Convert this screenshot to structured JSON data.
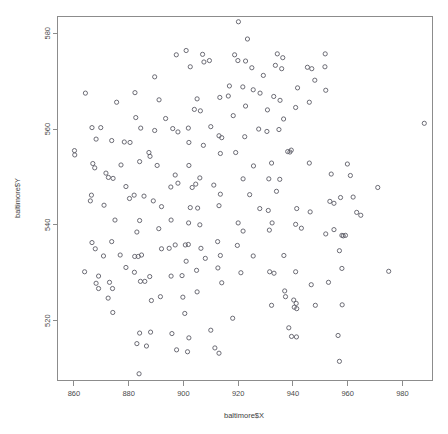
{
  "chart_data": {
    "type": "scatter",
    "title": "",
    "xlabel": "baltimore$X",
    "ylabel": "baltimore$Y",
    "xlim": [
      854,
      991
    ],
    "ylim": [
      507.5,
      583.5
    ],
    "xticks": [
      860,
      880,
      900,
      920,
      940,
      960,
      980
    ],
    "yticks": [
      520,
      540,
      560,
      580
    ],
    "xtick_labels": [
      "860",
      "880",
      "900",
      "920",
      "940",
      "960",
      "980"
    ],
    "ytick_labels": [
      "520",
      "540",
      "560",
      "580"
    ],
    "grid": false,
    "legend": null,
    "marker": "open-circle",
    "marker_size": 2.1,
    "point_color": "#5c5c66",
    "axis_color": "#8c8c8c",
    "background": "#ffffff",
    "n_points": 223,
    "points": [
      [
        920.1,
        582.4
      ],
      [
        923.4,
        578.8
      ],
      [
        901.0,
        576.4
      ],
      [
        897.4,
        575.5
      ],
      [
        907.0,
        575.6
      ],
      [
        918.7,
        575.5
      ],
      [
        934.3,
        575.7
      ],
      [
        936.3,
        574.9
      ],
      [
        951.8,
        575.7
      ],
      [
        902.5,
        573.0
      ],
      [
        907.5,
        574.0
      ],
      [
        909.5,
        574.3
      ],
      [
        919.9,
        574.3
      ],
      [
        922.7,
        574.2
      ],
      [
        933.6,
        573.3
      ],
      [
        945.3,
        572.9
      ],
      [
        946.9,
        572.6
      ],
      [
        951.7,
        573.0
      ],
      [
        925.0,
        572.8
      ],
      [
        935.9,
        572.6
      ],
      [
        889.5,
        570.9
      ],
      [
        916.8,
        569.0
      ],
      [
        921.7,
        568.8
      ],
      [
        925.5,
        568.2
      ],
      [
        941.7,
        568.6
      ],
      [
        952.0,
        568.1
      ],
      [
        864.2,
        567.5
      ],
      [
        882.3,
        567.6
      ],
      [
        933.0,
        566.8
      ],
      [
        875.6,
        565.6
      ],
      [
        891.1,
        566.1
      ],
      [
        905.0,
        566.3
      ],
      [
        913.3,
        566.6
      ],
      [
        935.3,
        566.0
      ],
      [
        946.0,
        565.6
      ],
      [
        922.7,
        564.8
      ],
      [
        904.0,
        564.1
      ],
      [
        906.2,
        563.8
      ],
      [
        930.7,
        564.0
      ],
      [
        941.0,
        564.5
      ],
      [
        882.6,
        562.4
      ],
      [
        893.5,
        562.2
      ],
      [
        918.2,
        562.8
      ],
      [
        936.6,
        562.1
      ],
      [
        988.0,
        561.2
      ],
      [
        866.6,
        560.3
      ],
      [
        869.8,
        560.3
      ],
      [
        884.4,
        560.2
      ],
      [
        889.5,
        559.7
      ],
      [
        896.1,
        560.1
      ],
      [
        898.0,
        559.4
      ],
      [
        901.8,
        560.2
      ],
      [
        927.5,
        560.0
      ],
      [
        930.5,
        559.5
      ],
      [
        934.9,
        559.9
      ],
      [
        913.0,
        558.6
      ],
      [
        914.0,
        558.2
      ],
      [
        922.4,
        558.4
      ],
      [
        868.1,
        557.9
      ],
      [
        873.8,
        557.6
      ],
      [
        878.4,
        557.3
      ],
      [
        880.5,
        557.2
      ],
      [
        902.0,
        557.2
      ],
      [
        907.3,
        556.6
      ],
      [
        860.2,
        555.5
      ],
      [
        860.3,
        554.6
      ],
      [
        887.4,
        555.1
      ],
      [
        887.8,
        554.3
      ],
      [
        919.1,
        555.1
      ],
      [
        913.5,
        554.9
      ],
      [
        938.1,
        555.3
      ],
      [
        938.9,
        555.2
      ],
      [
        939.4,
        555.6
      ],
      [
        866.9,
        552.8
      ],
      [
        867.6,
        551.9
      ],
      [
        877.2,
        552.5
      ],
      [
        890.4,
        552.4
      ],
      [
        902.0,
        552.4
      ],
      [
        925.6,
        552.3
      ],
      [
        932.2,
        552.9
      ],
      [
        946.0,
        552.9
      ],
      [
        959.9,
        552.7
      ],
      [
        871.7,
        550.8
      ],
      [
        872.6,
        549.9
      ],
      [
        874.3,
        549.7
      ],
      [
        897.0,
        550.4
      ],
      [
        954.0,
        550.6
      ],
      [
        961.0,
        550.3
      ],
      [
        898.0,
        548.7
      ],
      [
        904.5,
        548.5
      ],
      [
        906.0,
        549.8
      ],
      [
        921.8,
        549.6
      ],
      [
        931.2,
        549.6
      ],
      [
        935.2,
        549.5
      ],
      [
        895.4,
        547.9
      ],
      [
        903.2,
        547.8
      ],
      [
        911.1,
        548.3
      ],
      [
        971.0,
        547.8
      ],
      [
        882.0,
        546.2
      ],
      [
        866.4,
        546.2
      ],
      [
        913.5,
        546.4
      ],
      [
        924.2,
        546.3
      ],
      [
        885.6,
        546.0
      ],
      [
        880.3,
        545.5
      ],
      [
        957.4,
        545.7
      ],
      [
        962.0,
        545.8
      ],
      [
        953.5,
        544.9
      ],
      [
        955.0,
        544.5
      ],
      [
        871.0,
        544.1
      ],
      [
        892.0,
        543.8
      ],
      [
        913.0,
        544.0
      ],
      [
        902.5,
        543.6
      ],
      [
        905.2,
        543.5
      ],
      [
        927.9,
        543.4
      ],
      [
        931.0,
        543.0
      ],
      [
        941.4,
        543.4
      ],
      [
        946.3,
        542.7
      ],
      [
        963.3,
        542.6
      ],
      [
        964.8,
        542.0
      ],
      [
        875.0,
        541.0
      ],
      [
        884.0,
        540.9
      ],
      [
        895.5,
        541.0
      ],
      [
        901.9,
        540.4
      ],
      [
        906.0,
        540.0
      ],
      [
        920.0,
        540.4
      ],
      [
        932.4,
        540.4
      ],
      [
        941.0,
        540.1
      ],
      [
        943.1,
        539.3
      ],
      [
        883.0,
        538.5
      ],
      [
        891.0,
        539.2
      ],
      [
        931.4,
        538.9
      ],
      [
        921.8,
        538.7
      ],
      [
        952.0,
        538.1
      ],
      [
        957.9,
        537.8
      ],
      [
        958.4,
        537.7
      ],
      [
        959.2,
        537.8
      ],
      [
        866.6,
        536.3
      ],
      [
        873.8,
        536.5
      ],
      [
        912.5,
        536.5
      ],
      [
        897.0,
        535.8
      ],
      [
        900.7,
        535.8
      ],
      [
        901.8,
        535.9
      ],
      [
        919.7,
        535.7
      ],
      [
        867.8,
        535.0
      ],
      [
        892.0,
        535.0
      ],
      [
        894.8,
        535.1
      ],
      [
        906.4,
        535.1
      ],
      [
        957.0,
        534.6
      ],
      [
        870.8,
        533.5
      ],
      [
        876.9,
        533.7
      ],
      [
        882.2,
        533.4
      ],
      [
        883.5,
        533.4
      ],
      [
        884.7,
        533.7
      ],
      [
        913.5,
        533.6
      ],
      [
        925.5,
        533.5
      ],
      [
        936.7,
        533.6
      ],
      [
        901.0,
        532.4
      ],
      [
        879.0,
        531.1
      ],
      [
        912.6,
        531.0
      ],
      [
        957.9,
        530.9
      ],
      [
        863.9,
        530.2
      ],
      [
        882.1,
        530.1
      ],
      [
        904.8,
        530.5
      ],
      [
        931.5,
        530.2
      ],
      [
        933.1,
        529.9
      ],
      [
        941.0,
        530.2
      ],
      [
        975.0,
        530.3
      ],
      [
        869.0,
        529.3
      ],
      [
        887.7,
        529.2
      ],
      [
        895.5,
        529.3
      ],
      [
        899.5,
        529.4
      ],
      [
        868.1,
        527.8
      ],
      [
        884.3,
        528.2
      ],
      [
        885.9,
        528.2
      ],
      [
        914.0,
        527.9
      ],
      [
        946.7,
        527.5
      ],
      [
        874.1,
        526.7
      ],
      [
        869.0,
        526.7
      ],
      [
        937.0,
        526.2
      ],
      [
        872.5,
        524.7
      ],
      [
        888.3,
        524.2
      ],
      [
        891.6,
        525.0
      ],
      [
        899.8,
        524.9
      ],
      [
        937.3,
        525.0
      ],
      [
        940.3,
        524.3
      ],
      [
        941.2,
        523.6
      ],
      [
        932.2,
        523.2
      ],
      [
        940.5,
        522.8
      ],
      [
        941.4,
        522.5
      ],
      [
        948.2,
        523.2
      ],
      [
        958.0,
        523.3
      ],
      [
        874.2,
        521.7
      ],
      [
        900.5,
        521.5
      ],
      [
        938.5,
        518.5
      ],
      [
        884.0,
        517.4
      ],
      [
        888.0,
        517.6
      ],
      [
        895.8,
        517.3
      ],
      [
        910.0,
        518.0
      ],
      [
        902.0,
        516.4
      ],
      [
        939.5,
        516.7
      ],
      [
        941.3,
        516.6
      ],
      [
        956.5,
        516.9
      ],
      [
        883.0,
        515.2
      ],
      [
        886.5,
        514.7
      ],
      [
        897.5,
        513.9
      ],
      [
        901.5,
        513.5
      ],
      [
        911.5,
        514.3
      ],
      [
        913.0,
        513.2
      ],
      [
        957.0,
        511.5
      ],
      [
        883.8,
        508.9
      ],
      [
        916.4,
        566.9
      ],
      [
        928.0,
        567.5
      ],
      [
        910.0,
        560.5
      ],
      [
        884.0,
        553.2
      ],
      [
        929.2,
        571.2
      ],
      [
        948.0,
        570.2
      ],
      [
        879.0,
        548.0
      ],
      [
        955.0,
        539.0
      ],
      [
        889.0,
        545.0
      ],
      [
        934.0,
        547.0
      ],
      [
        908.0,
        533.0
      ],
      [
        921.0,
        530.0
      ],
      [
        873.0,
        528.0
      ],
      [
        918.0,
        520.5
      ],
      [
        905.0,
        526.0
      ],
      [
        866.0,
        545.0
      ],
      [
        953.0,
        528.0
      ]
    ]
  }
}
